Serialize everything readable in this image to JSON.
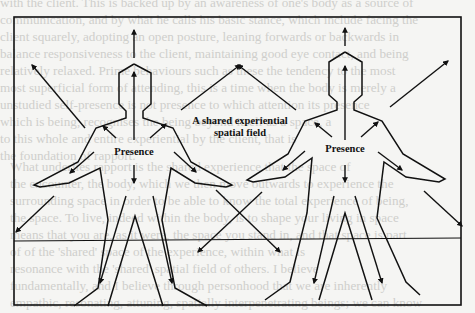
{
  "figure": {
    "labels": {
      "left_presence": "Presence",
      "right_presence": "Presence",
      "shared_field_line1": "A shared experiential",
      "shared_field_line2": "spatial field"
    },
    "colors": {
      "ink": "#111111",
      "paper": "#f5f5f3",
      "bleed_text": "#cfcfcc"
    }
  },
  "bleed_through_text": {
    "top": [
      "with the client. This is backed up by an awareness of one's body as a source of",
      "communication, and by what he calls his basic stance, which include facing the",
      "client squarely, adopting an open posture, leaning forwards or backwards in",
      "balance responsiveness to the client, maintaining good eye contact, and being",
      "relatively relaxed. Prime behaviours such as these the tendency to the most",
      "most superficial form of attending, this is a time when the body is merely a",
      "unstudied self-presence is not presence to which attention its presence",
      "which is being, recognises the being beyond itself as a space, a",
      "to this whole and entire experiential by the client, that is",
      "the foundation of rapport."
    ],
    "right": [
      "What underlies rapport is the shared experience that the space of",
      "the encounter, the body, which we then move outwards to experience the",
      "surrounding space in order to be able to know the total experience of being,",
      "the space. To live, indeed within the body, is to shape your living in space",
      "means that you are, as it were, the space you stand in, and that space is part",
      "of of the 'shared' space of the experience, within what is",
      "resonance with the 'shared' spatial field of others. I believe",
      "fundamentally, and I believe through personhood that we are inherently",
      "empathic, resonating, attuning, spatially interpenetrating beings; we can know",
      "each other through the shared experience of shared phenomenal space in"
    ]
  }
}
